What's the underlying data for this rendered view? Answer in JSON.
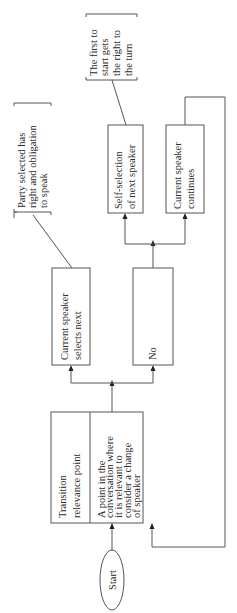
{
  "diagram": {
    "orientation": "rotated-90-counterclockwise",
    "colors": {
      "stroke": "#555555",
      "text": "#2a2a2a",
      "background": "#ffffff"
    },
    "start": {
      "label": "Start"
    },
    "transition_box": {
      "title_lines": [
        "Transition",
        "relevance point"
      ],
      "desc_lines": [
        "A point in the",
        "conversation where",
        "it is relevant to",
        "consider a change",
        "of speaker"
      ]
    },
    "current_selects": {
      "lines": [
        "Current speaker",
        "selects next"
      ]
    },
    "no_box": {
      "label": "No"
    },
    "self_selection": {
      "lines": [
        "Self-selection",
        "of next speaker"
      ]
    },
    "current_continues": {
      "lines": [
        "Current speaker",
        "continues"
      ]
    },
    "callout_party": {
      "lines": [
        "Party selected has",
        "right and obligation",
        "to speak"
      ]
    },
    "callout_first": {
      "lines": [
        "The first to",
        "start gets",
        "the right to",
        "the turn"
      ]
    }
  }
}
